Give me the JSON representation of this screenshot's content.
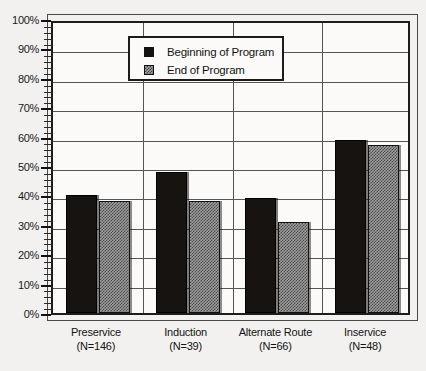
{
  "chart_data": {
    "type": "bar",
    "title": "",
    "subtitle": "",
    "xlabel": "",
    "ylabel": "",
    "ylim": [
      0,
      100
    ],
    "ytick_labels": [
      "0%",
      "10%",
      "20%",
      "30%",
      "40%",
      "50%",
      "60%",
      "70%",
      "80%",
      "90%",
      "100%"
    ],
    "ytick_values": [
      0,
      10,
      20,
      30,
      40,
      50,
      60,
      70,
      80,
      90,
      100
    ],
    "minor_tick_step": 2,
    "grid": "horizontal-and-group-separators",
    "legend_position": "top-center",
    "categories": [
      "Preservice",
      "Induction",
      "Alternate Route",
      "Inservice"
    ],
    "category_counts": [
      "(N=146)",
      "(N=39)",
      "(N=66)",
      "(N=48)"
    ],
    "category_labels": [
      "Preservice\n(N=146)",
      "Induction\n(N=39)",
      "Alternate Route\n(N=66)",
      "Inservice\n(N=48)"
    ],
    "series": [
      {
        "name": "Beginning of Program",
        "color": "#161311",
        "pattern": "solid",
        "values": [
          40,
          48,
          39,
          59
        ]
      },
      {
        "name": "End of Program",
        "color": "#9e9e9e",
        "pattern": "checker",
        "values": [
          38,
          38,
          31,
          57
        ]
      }
    ]
  },
  "legend": {
    "items": [
      {
        "label": "Beginning of Program",
        "swatch": "solid-dark"
      },
      {
        "label": "End of Program",
        "swatch": "checker-gray"
      }
    ]
  },
  "axes": {
    "y": {
      "labels": [
        "100%",
        "90%",
        "80%",
        "70%",
        "60%",
        "50%",
        "40%",
        "30%",
        "20%",
        "10%",
        "0%"
      ]
    },
    "x": {
      "groups": [
        {
          "name": "Preservice",
          "count": "(N=146)"
        },
        {
          "name": "Induction",
          "count": "(N=39)"
        },
        {
          "name": "Alternate Route",
          "count": "(N=66)"
        },
        {
          "name": "Inservice",
          "count": "(N=48)"
        }
      ]
    }
  },
  "colors": {
    "background": "#f2f1ef",
    "plot_background": "#fbfaf8",
    "axis": "#1d1d1d",
    "grid": "#555555",
    "series_beginning": "#161311",
    "series_end": "#9e9e9e"
  }
}
